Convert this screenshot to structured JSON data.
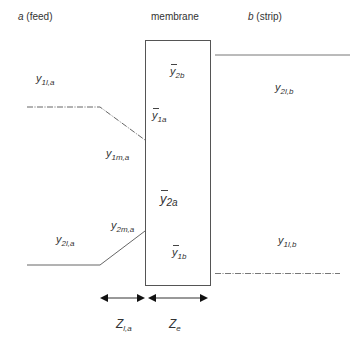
{
  "headers": {
    "feed_var": "a",
    "feed_text": " (feed)",
    "membrane": "membrane",
    "strip_var": "b",
    "strip_text": " (strip)"
  },
  "labels": {
    "y1la": {
      "base": "y",
      "sub": "1l,a"
    },
    "y1ma": {
      "base": "y",
      "sub": "1m,a"
    },
    "y2ma": {
      "base": "y",
      "sub": "2m,a"
    },
    "y2la": {
      "base": "y",
      "sub": "2l,a"
    },
    "ybar2b": {
      "base": "y",
      "sub": "2b"
    },
    "ybar1a": {
      "base": "y",
      "sub": "1a"
    },
    "ybar2a": {
      "base": "y",
      "sub": "2a"
    },
    "ybar1b": {
      "base": "y",
      "sub": "1b"
    },
    "y2lb": {
      "base": "y",
      "sub": "2l,b"
    },
    "y1lb": {
      "base": "y",
      "sub": "1l,b"
    },
    "zla": {
      "base": "Z",
      "sub": "l,a"
    },
    "ze": {
      "base": "Z",
      "sub": "e"
    }
  },
  "colors": {
    "line": "#555555",
    "text": "#333333"
  }
}
